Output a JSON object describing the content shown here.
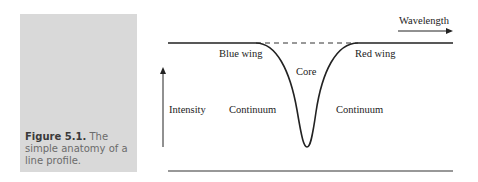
{
  "caption": {
    "figure_number": "Figure 5.1.",
    "text": "The simple anatomy of a line profile.",
    "background_color": "#d9d9d9"
  },
  "diagram": {
    "type": "line-profile",
    "labels": {
      "wavelength_axis": "Wavelength",
      "intensity_axis": "Intensity",
      "blue_wing": "Blue wing",
      "red_wing": "Red wing",
      "core": "Core",
      "continuum_left": "Continuum",
      "continuum_right": "Continuum"
    },
    "line_color": "#222222"
  }
}
